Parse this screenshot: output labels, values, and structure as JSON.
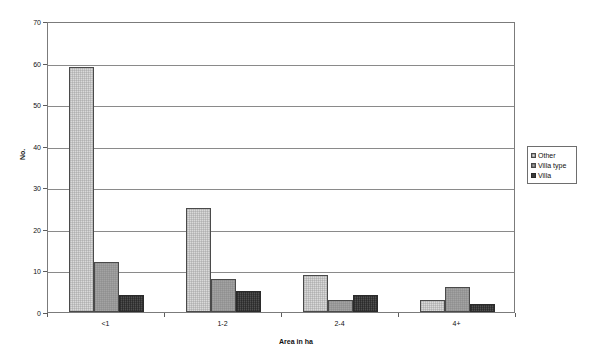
{
  "chart_data": {
    "type": "bar",
    "title": "",
    "subtitle": "",
    "xlabel": "Area in ha",
    "ylabel": "No.",
    "categories": [
      "<1",
      "1-2",
      "2-4",
      "4+"
    ],
    "series": [
      {
        "name": "Other",
        "values": [
          59,
          25,
          9,
          3
        ],
        "color": "#d9d9d9"
      },
      {
        "name": "Villa type",
        "values": [
          12,
          8,
          3,
          6
        ],
        "color": "#a3a3a3"
      },
      {
        "name": "Villa",
        "values": [
          4,
          5,
          4,
          2
        ],
        "color": "#4f4f4f"
      }
    ],
    "ylim": [
      0,
      70
    ],
    "ytick_values": [
      0,
      10,
      20,
      30,
      40,
      50,
      60,
      70
    ],
    "ytick_labels": [
      "0",
      "10",
      "20",
      "30",
      "40",
      "50",
      "60",
      "70"
    ],
    "grid": true,
    "grid_axis": "y",
    "legend_position": "right",
    "orientation": "vertical",
    "grouping": "grouped"
  },
  "legend": {
    "entries": [
      {
        "label": "Other"
      },
      {
        "label": "Villa type"
      },
      {
        "label": "Villa"
      }
    ]
  },
  "axes": {
    "y_title": "No.",
    "x_title": "Area in ha"
  }
}
